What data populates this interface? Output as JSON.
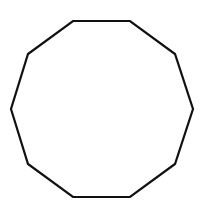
{
  "diagram": {
    "shape": "decagon",
    "sides": 10,
    "stroke_color": "#111111",
    "fill_color": "#ffffff",
    "stroke_width": 2.2,
    "points": "73,21 130,21 175,54 193,109 175,164 130,197 73,197 28,164 11,109 28,54"
  }
}
